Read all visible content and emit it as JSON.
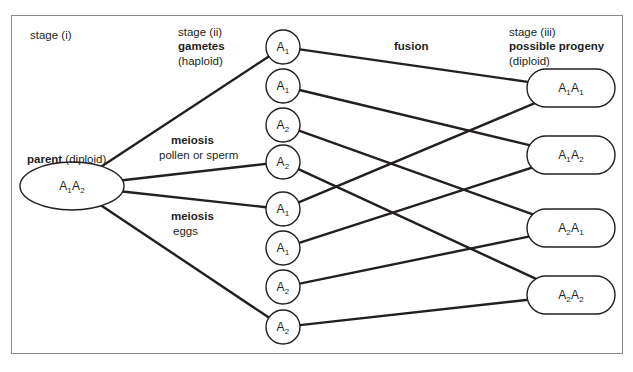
{
  "figure": {
    "clipped_header_text": "",
    "border_color": "#8a8a8a",
    "line_color": "#231f20",
    "background": "#ffffff"
  },
  "labels": {
    "stage_i": "stage (i)",
    "parent_bold": "parent",
    "parent_rest": " (diploid)",
    "stage_ii": "stage (ii)",
    "gametes_bold": "gametes",
    "gametes_rest": "(haploid)",
    "meiosis_top_bold": "meiosis",
    "meiosis_top_rest": "pollen or sperm",
    "meiosis_bottom_bold": "meiosis",
    "meiosis_bottom_rest": "eggs",
    "fusion_bold": "fusion",
    "stage_iii": "stage (iii)",
    "progeny_bold": "possible progeny",
    "progeny_rest": "(diploid)"
  },
  "parent": {
    "id": "parent",
    "allele_1": "A",
    "sub_1": "1",
    "allele_2": "A",
    "sub_2": "2",
    "cx": 72,
    "cy": 186,
    "rx": 52,
    "ry": 24
  },
  "gametes": [
    {
      "id": "gamete-1",
      "allele": "A",
      "sub": "1",
      "group": "pollen",
      "cx": 283,
      "cy": 47,
      "r": 17
    },
    {
      "id": "gamete-2",
      "allele": "A",
      "sub": "1",
      "group": "pollen",
      "cx": 283,
      "cy": 86,
      "r": 17
    },
    {
      "id": "gamete-3",
      "allele": "A",
      "sub": "2",
      "group": "pollen",
      "cx": 283,
      "cy": 125,
      "r": 17
    },
    {
      "id": "gamete-4",
      "allele": "A",
      "sub": "2",
      "group": "pollen",
      "cx": 283,
      "cy": 162,
      "r": 17
    },
    {
      "id": "gamete-5",
      "allele": "A",
      "sub": "1",
      "group": "egg",
      "cx": 283,
      "cy": 209,
      "r": 17
    },
    {
      "id": "gamete-6",
      "allele": "A",
      "sub": "1",
      "group": "egg",
      "cx": 283,
      "cy": 248,
      "r": 17
    },
    {
      "id": "gamete-7",
      "allele": "A",
      "sub": "2",
      "group": "egg",
      "cx": 283,
      "cy": 287,
      "r": 17
    },
    {
      "id": "gamete-8",
      "allele": "A",
      "sub": "2",
      "group": "egg",
      "cx": 283,
      "cy": 327,
      "r": 17
    }
  ],
  "progeny": [
    {
      "id": "progeny-1",
      "a1": "A",
      "s1": "1",
      "a2": "A",
      "s2": "1",
      "cx": 571,
      "cy": 88,
      "rx": 44,
      "ry": 19
    },
    {
      "id": "progeny-2",
      "a1": "A",
      "s1": "1",
      "a2": "A",
      "s2": "2",
      "cx": 571,
      "cy": 155,
      "rx": 44,
      "ry": 19
    },
    {
      "id": "progeny-3",
      "a1": "A",
      "s1": "2",
      "a2": "A",
      "s2": "1",
      "cx": 571,
      "cy": 228,
      "rx": 44,
      "ry": 19
    },
    {
      "id": "progeny-4",
      "a1": "A",
      "s1": "2",
      "a2": "A",
      "s2": "2",
      "cx": 571,
      "cy": 295,
      "rx": 44,
      "ry": 19
    }
  ],
  "meiosis_lines": [
    {
      "from": "parent",
      "to": "gamete-1"
    },
    {
      "from": "parent",
      "to": "gamete-4"
    },
    {
      "from": "parent",
      "to": "gamete-5"
    },
    {
      "from": "parent",
      "to": "gamete-8"
    }
  ],
  "fusion_lines": [
    {
      "from": "gamete-1",
      "to": "progeny-1"
    },
    {
      "from": "gamete-2",
      "to": "progeny-2"
    },
    {
      "from": "gamete-3",
      "to": "progeny-3"
    },
    {
      "from": "gamete-4",
      "to": "progeny-4"
    },
    {
      "from": "gamete-5",
      "to": "progeny-1"
    },
    {
      "from": "gamete-6",
      "to": "progeny-2"
    },
    {
      "from": "gamete-7",
      "to": "progeny-3"
    },
    {
      "from": "gamete-8",
      "to": "progeny-4"
    }
  ]
}
